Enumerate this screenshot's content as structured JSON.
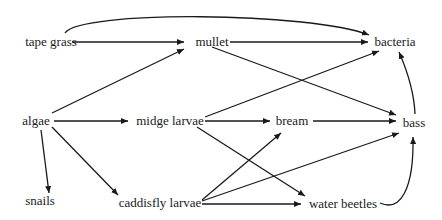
{
  "diagram": {
    "type": "food-web",
    "nodes": [
      {
        "id": "tape_grass",
        "label": "tape grass",
        "x": 51,
        "y": 42
      },
      {
        "id": "mullet",
        "label": "mullet",
        "x": 212,
        "y": 42
      },
      {
        "id": "bacteria",
        "label": "bacteria",
        "x": 393,
        "y": 42
      },
      {
        "id": "algae",
        "label": "algae",
        "x": 36,
        "y": 121
      },
      {
        "id": "midge_larvae",
        "label": "midge larvae",
        "x": 170,
        "y": 121
      },
      {
        "id": "bream",
        "label": "bream",
        "x": 290,
        "y": 121
      },
      {
        "id": "bass",
        "label": "bass",
        "x": 413,
        "y": 123
      },
      {
        "id": "snails",
        "label": "snails",
        "x": 40,
        "y": 200
      },
      {
        "id": "caddisfly_larvae",
        "label": "caddisfly larvae",
        "x": 169,
        "y": 203
      },
      {
        "id": "water_beetles",
        "label": "water beetles",
        "x": 340,
        "y": 203
      }
    ],
    "edges": [
      {
        "from": "tape grass",
        "to": "mullet"
      },
      {
        "from": "tape grass",
        "to": "bacteria",
        "curved": true
      },
      {
        "from": "mullet",
        "to": "bacteria"
      },
      {
        "from": "mullet",
        "to": "bass"
      },
      {
        "from": "algae",
        "to": "mullet"
      },
      {
        "from": "algae",
        "to": "midge larvae"
      },
      {
        "from": "algae",
        "to": "snails"
      },
      {
        "from": "algae",
        "to": "caddisfly larvae"
      },
      {
        "from": "midge larvae",
        "to": "bream"
      },
      {
        "from": "midge larvae",
        "to": "bacteria"
      },
      {
        "from": "midge larvae",
        "to": "water beetles"
      },
      {
        "from": "caddisfly larvae",
        "to": "bream"
      },
      {
        "from": "caddisfly larvae",
        "to": "bass"
      },
      {
        "from": "caddisfly larvae",
        "to": "water beetles"
      },
      {
        "from": "bream",
        "to": "bass"
      },
      {
        "from": "bass",
        "to": "bacteria"
      },
      {
        "from": "water beetles",
        "to": "bass",
        "curved": true
      }
    ],
    "colors": {
      "line": "#1a1a1a",
      "text": "#1a1a1a",
      "background": "#ffffff"
    }
  }
}
